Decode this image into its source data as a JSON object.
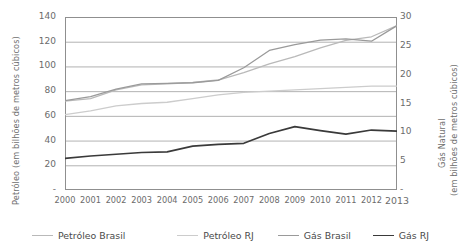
{
  "axes": {
    "ylabel_left": "Petróleo (em bilhões de metros cúbicos)",
    "ylabel_right_line1": "Gás Natural",
    "ylabel_right_line2": "(em bilhões de metros cúbicos)",
    "yticks_left": [
      "140",
      "120",
      "100",
      "80",
      "60",
      "40",
      "20",
      "-"
    ],
    "yticks_right": [
      "30",
      "25",
      "20",
      "15",
      "10",
      "5",
      "-"
    ]
  },
  "legend": {
    "items": [
      {
        "label": "Petróleo Brasil",
        "color": "#b9b9b9",
        "width": 1.3
      },
      {
        "label": "Petróleo RJ",
        "color": "#cccccc",
        "width": 1.3
      },
      {
        "label": "Gás Brasil",
        "color": "#9a9a9a",
        "width": 1.3
      },
      {
        "label": "Gás RJ",
        "color": "#3a3a3a",
        "width": 1.7
      }
    ]
  },
  "chart_data": {
    "type": "line",
    "title": "",
    "xlabel": "",
    "ylabel": "Petróleo (em bilhões de metros cúbicos)",
    "ylabel_secondary": "Gás Natural (em bilhões de metros cúbicos)",
    "categories": [
      "2000",
      "2001",
      "2002",
      "2003",
      "2004",
      "2005",
      "2006",
      "2007",
      "2008",
      "2009",
      "2010",
      "2011",
      "2012",
      "2013"
    ],
    "ylim": [
      0,
      140
    ],
    "ylim_secondary": [
      0,
      30
    ],
    "ytick_step": 20,
    "ytick_step_secondary": 5,
    "grid": true,
    "legend_position": "bottom",
    "series": [
      {
        "name": "Petróleo Brasil",
        "axis": "left",
        "color": "#b9b9b9",
        "values": [
          72,
          74,
          81,
          85,
          86,
          87,
          89,
          95,
          102,
          108,
          115,
          121,
          124,
          133
        ]
      },
      {
        "name": "Petróleo RJ",
        "axis": "left",
        "color": "#cccccc",
        "values": [
          61,
          64,
          68,
          70,
          71,
          74,
          77,
          79,
          80,
          81,
          82,
          83,
          84,
          84
        ]
      },
      {
        "name": "Gás Brasil",
        "axis": "right",
        "color": "#9a9a9a",
        "values": [
          15.5,
          16.2,
          17.5,
          18.4,
          18.5,
          18.6,
          19.0,
          21.2,
          24.2,
          25.2,
          26.0,
          26.2,
          25.8,
          28.5
        ]
      },
      {
        "name": "Gás RJ",
        "axis": "right",
        "color": "#3a3a3a",
        "values": [
          5.5,
          5.9,
          6.2,
          6.5,
          6.6,
          7.6,
          7.9,
          8.1,
          9.8,
          11.0,
          10.3,
          9.7,
          10.4,
          10.2
        ]
      }
    ]
  }
}
